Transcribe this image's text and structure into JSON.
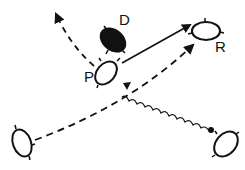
{
  "diagram": {
    "type": "interaction-diagram",
    "background": "#ffffff",
    "ink_color": "#111111",
    "nodes": [
      {
        "id": "D",
        "label": "D",
        "shape": "ellipse",
        "filled": true,
        "cx": 113,
        "cy": 40
      },
      {
        "id": "P",
        "label": "P",
        "shape": "ellipse",
        "filled": false,
        "cx": 106,
        "cy": 73
      },
      {
        "id": "R",
        "label": "R",
        "shape": "ellipse",
        "filled": false,
        "cx": 206,
        "cy": 31
      },
      {
        "id": "bottom-left",
        "label": "",
        "shape": "ellipse",
        "filled": false,
        "cx": 22,
        "cy": 143
      },
      {
        "id": "bottom-right",
        "label": "",
        "shape": "ellipse",
        "filled": false,
        "cx": 226,
        "cy": 144
      }
    ],
    "edges": [
      {
        "from": "P",
        "to": "offscreen-top-left",
        "style": "dashed",
        "arrow": "end",
        "curved": true
      },
      {
        "from": "P",
        "to": "R",
        "style": "solid",
        "arrow": "end"
      },
      {
        "from": "bottom-left",
        "to": "R",
        "style": "dashed",
        "arrow": "end",
        "curved": true
      },
      {
        "from": "bottom-right",
        "to": "P",
        "style": "wavy",
        "arrow": "end",
        "source_dot": true
      }
    ]
  }
}
